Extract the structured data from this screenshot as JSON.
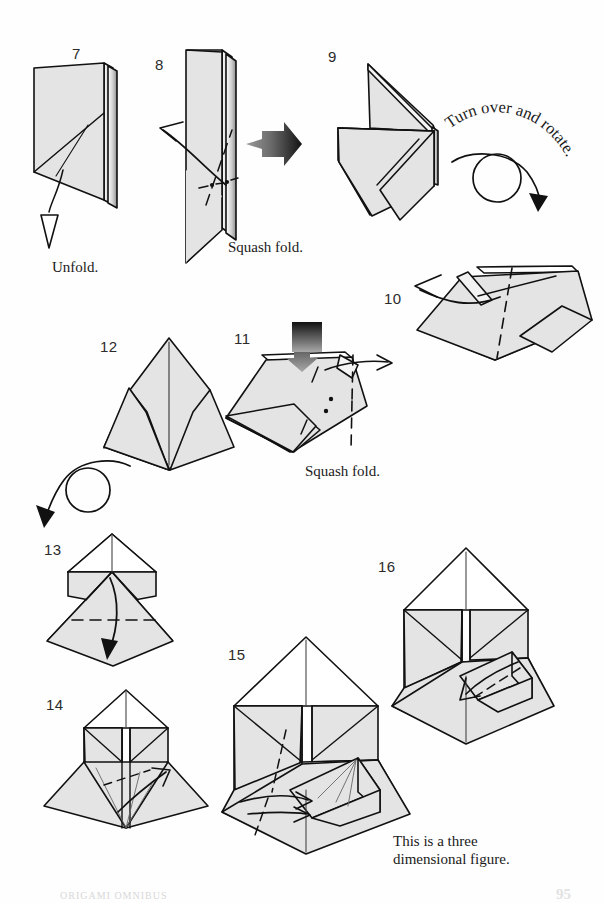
{
  "page": {
    "page_number": "95",
    "footer_text": "ORIGAMI OMNIBUS",
    "paper_fill": "#e4e4e4",
    "paper_fill_shadow": "#c9c9c9",
    "line_color": "#111111",
    "background": "#ffffff"
  },
  "steps": [
    {
      "number": "7",
      "caption": "Unfold."
    },
    {
      "number": "8",
      "caption": "Squash fold."
    },
    {
      "number": "9",
      "caption": "Turn over and rotate."
    },
    {
      "number": "10",
      "caption": ""
    },
    {
      "number": "11",
      "caption": "Squash fold."
    },
    {
      "number": "12",
      "caption": ""
    },
    {
      "number": "13",
      "caption": ""
    },
    {
      "number": "14",
      "caption": ""
    },
    {
      "number": "15",
      "caption": ""
    },
    {
      "number": "16",
      "caption": "This is a three\ndimensional figure."
    }
  ],
  "labels": {
    "unfold": "Unfold.",
    "squash_fold_8": "Squash fold.",
    "squash_fold_11": "Squash fold.",
    "turn_over_rotate": "Turn over and rotate.",
    "three_dimensional": "This is a three\ndimensional figure."
  },
  "annotations": {
    "arrow_types": [
      "unfold-arrow-hollow",
      "squash-push-arrow-solid",
      "valley-fold-arrow",
      "turn-over-rotate-arrow",
      "fold-direction-arrow"
    ]
  }
}
